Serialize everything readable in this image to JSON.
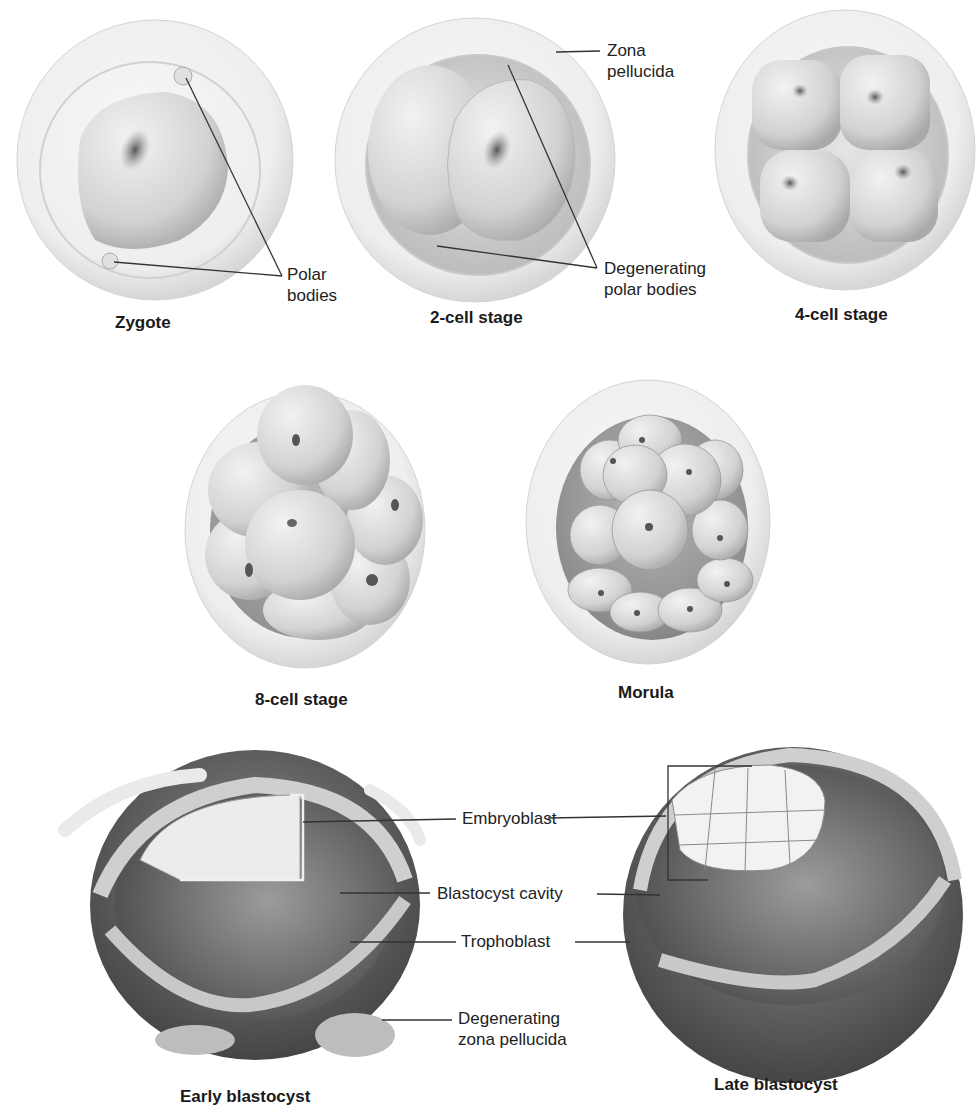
{
  "stages": {
    "zygote": {
      "caption": "Zygote"
    },
    "two_cell": {
      "caption": "2-cell stage"
    },
    "four_cell": {
      "caption": "4-cell stage"
    },
    "eight_cell": {
      "caption": "8-cell stage"
    },
    "morula": {
      "caption": "Morula"
    },
    "early_blastocyst": {
      "caption": "Early blastocyst"
    },
    "late_blastocyst": {
      "caption": "Late blastocyst"
    }
  },
  "labels": {
    "polar_bodies": {
      "line1": "Polar",
      "line2": "bodies"
    },
    "zona_pellucida": {
      "line1": "Zona",
      "line2": "pellucida"
    },
    "degenerating_polar_bodies": {
      "line1": "Degenerating",
      "line2": "polar bodies"
    },
    "embryoblast": "Embryoblast",
    "blastocyst_cavity": "Blastocyst cavity",
    "trophoblast": "Trophoblast",
    "degenerating_zona_pellucida": {
      "line1": "Degenerating",
      "line2": "zona pellucida"
    }
  },
  "colors": {
    "zona": "#ededed",
    "zona_edge": "#cfcfcf",
    "cell_light": "#e4e4e4",
    "cell_mid": "#c9c9c9",
    "cell_dark": "#8a8a8a",
    "nucleus": "#6e6e6e",
    "cavity": "#5a5a5a",
    "leader": "#333333"
  }
}
